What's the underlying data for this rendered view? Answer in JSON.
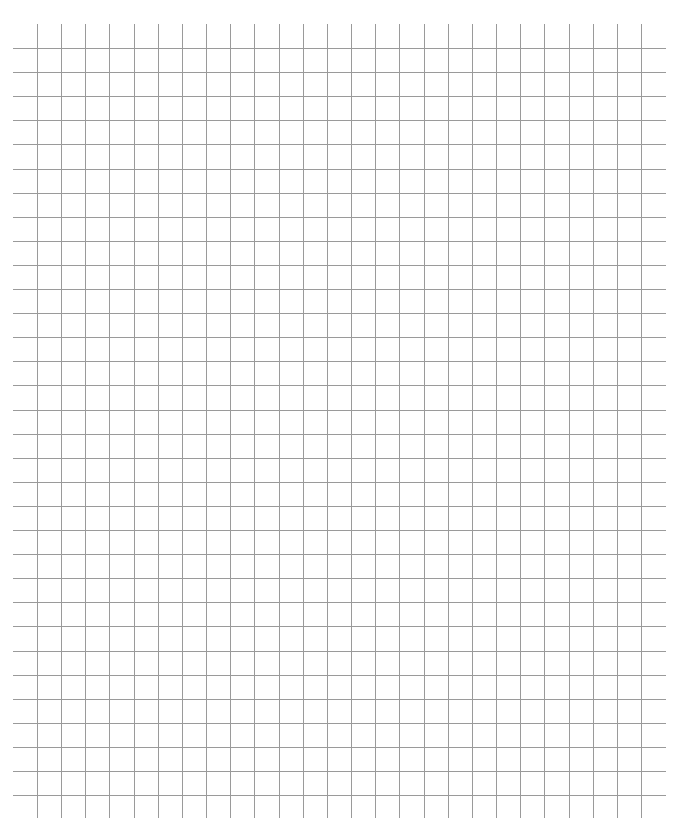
{
  "page": {
    "background": "#ffffff"
  },
  "grid": {
    "line_color": "#9a9a9a",
    "line_width": 1,
    "vertical": {
      "first_x": 37,
      "spacing": 24.16,
      "count": 26,
      "y_start": 24,
      "y_end": 818
    },
    "horizontal": {
      "first_y": 48,
      "spacing": 24.1,
      "count": 32,
      "x_start": 13,
      "x_end": 666
    }
  }
}
